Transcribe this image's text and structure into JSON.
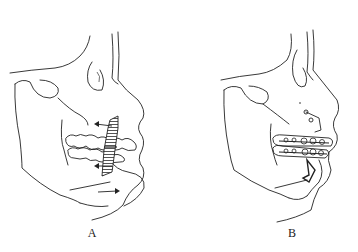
{
  "figure": {
    "panels": [
      {
        "id": "A",
        "label": "A",
        "description": "Lateral facial skeleton outline with hatched osteotomy segment at anterior maxilla/mandible, arrows indicating directions of movement"
      },
      {
        "id": "B",
        "label": "B",
        "description": "Lateral facial skeleton outline with orthodontic brackets on dentition and fixation plates at osteotomy site"
      }
    ],
    "colors": {
      "line": "#222222",
      "hatch": "#555555",
      "background": "#ffffff"
    }
  }
}
